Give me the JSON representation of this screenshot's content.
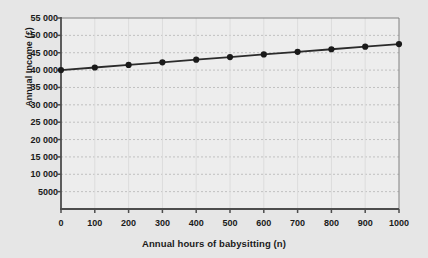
{
  "chart_data": {
    "type": "line",
    "title": "",
    "xlabel": "Annual hours of babysitting (n)",
    "ylabel": "Annual Income (£)",
    "x": [
      0,
      100,
      200,
      300,
      400,
      500,
      600,
      700,
      800,
      900,
      1000
    ],
    "values": [
      40000,
      40750,
      41500,
      42250,
      43000,
      43750,
      44500,
      45250,
      46000,
      46750,
      47500
    ],
    "series": [
      {
        "name": "Annual income",
        "values": [
          40000,
          40750,
          41500,
          42250,
          43000,
          43750,
          44500,
          45250,
          46000,
          46750,
          47500
        ]
      }
    ],
    "xlim": [
      0,
      1000
    ],
    "ylim": [
      0,
      55000
    ],
    "xticks": [
      0,
      100,
      200,
      300,
      400,
      500,
      600,
      700,
      800,
      900,
      1000
    ],
    "xtick_labels": [
      "0",
      "100",
      "200",
      "300",
      "400",
      "500",
      "600",
      "700",
      "800",
      "900",
      "1000"
    ],
    "yticks": [
      5000,
      10000,
      15000,
      20000,
      25000,
      30000,
      35000,
      40000,
      45000,
      50000,
      55000
    ],
    "ytick_labels": [
      "5000",
      "10 000",
      "15 000",
      "20 000",
      "25 000",
      "30 000",
      "35 000",
      "40 000",
      "45 000",
      "50 000",
      "55 000"
    ],
    "grid": "horizontal-dashed",
    "legend": "none",
    "marker": "filled-circle",
    "line_color": "#2b2b2b",
    "marker_color": "#1a1a1a",
    "grid_color": "#c0c0c0",
    "axis_color": "#4d4d4d",
    "background_color": "#e6e6e6",
    "plot_background_color": "#ededed"
  }
}
